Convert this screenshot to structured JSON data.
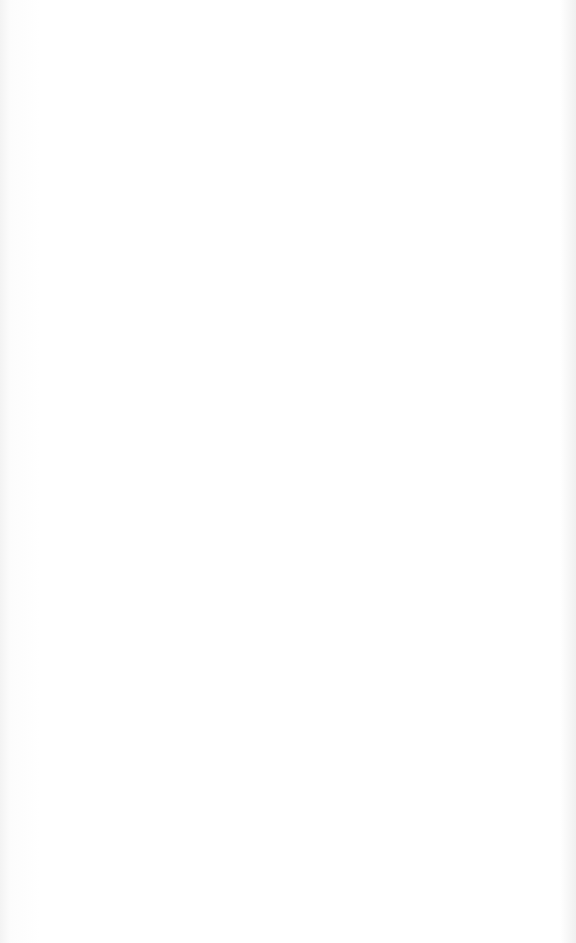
{
  "page": {
    "type": "lined-paper",
    "line_count": 30,
    "line_color": "#8a8a8a",
    "background_color": "#ffffff"
  }
}
